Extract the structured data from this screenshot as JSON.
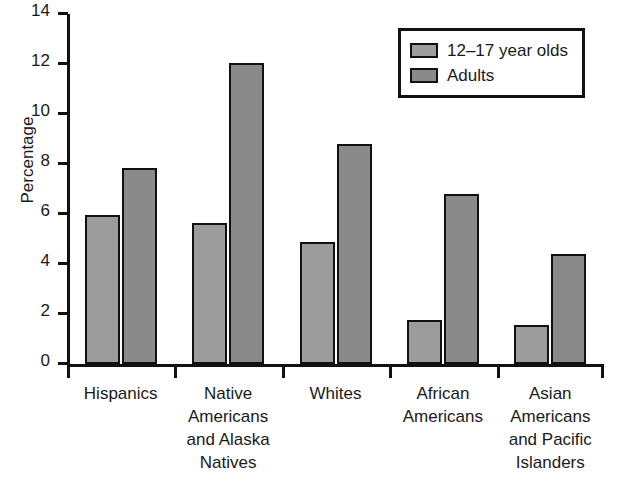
{
  "chart_data": {
    "type": "bar",
    "title": "",
    "xlabel": "",
    "ylabel": "Percentage",
    "ylim": [
      0,
      14
    ],
    "yticks": [
      0,
      2,
      4,
      6,
      8,
      10,
      12,
      14
    ],
    "ytick_labels": [
      "0",
      "2",
      "4",
      "6",
      "8",
      "10",
      "12",
      "14"
    ],
    "grid": false,
    "legend_position": "top-right",
    "categories": [
      "Hispanics",
      "Native Americans and Alaska Natives",
      "Whites",
      "African Americans",
      "Asian Americans and Pacific Islanders"
    ],
    "category_label_lines": [
      [
        "Hispanics"
      ],
      [
        "Native",
        "Americans",
        "and Alaska",
        "Natives"
      ],
      [
        "Whites"
      ],
      [
        "African",
        "Americans"
      ],
      [
        "Asian",
        "Americans",
        "and Pacific",
        "Islanders"
      ]
    ],
    "series": [
      {
        "name": "12–17 year olds",
        "color": "#9c9c9c",
        "values": [
          5.95,
          5.65,
          4.9,
          1.75,
          1.55
        ]
      },
      {
        "name": "Adults",
        "color": "#8a8a8a",
        "values": [
          7.85,
          12.05,
          8.8,
          6.8,
          4.4
        ]
      }
    ]
  },
  "legend": {
    "items": [
      {
        "label": "12–17 year olds",
        "color": "#9c9c9c"
      },
      {
        "label": "Adults",
        "color": "#8a8a8a"
      }
    ]
  },
  "colors": {
    "axis": "#111111",
    "text": "#1a1a1a",
    "background": "#ffffff",
    "series_1": "#9c9c9c",
    "series_2": "#8a8a8a"
  }
}
